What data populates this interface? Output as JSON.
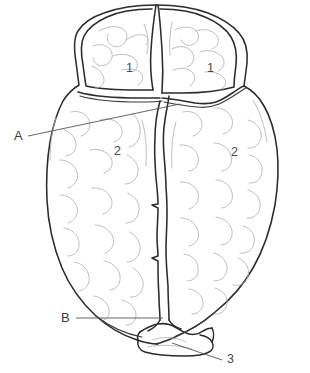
{
  "figure": {
    "kind": "anatomical-line-drawing",
    "view": "superior-dorsal-view-of-brain",
    "background_color": "#ffffff",
    "outline_color": "#2b2b2f",
    "gyrus_color": "#b3b3b8",
    "leader_color": "#55555c",
    "text_color": "#3b3b40"
  },
  "labels": {
    "letter_a": "A",
    "letter_b": "B",
    "number_1_left": "1",
    "number_1_right": "1",
    "number_2_left": "2",
    "number_2_right": "2",
    "number_3": "3"
  },
  "callouts": [
    {
      "text": "A",
      "target": "transverse-fissure"
    },
    {
      "text": "B",
      "target": "longitudinal-fissure-posterior"
    },
    {
      "text": "3",
      "target": "cerebellum"
    }
  ],
  "regions": [
    {
      "id": "frontal-lobe-left",
      "label": "1"
    },
    {
      "id": "frontal-lobe-right",
      "label": "1"
    },
    {
      "id": "cerebral-hemisphere-left",
      "label": "2"
    },
    {
      "id": "cerebral-hemisphere-right",
      "label": "2"
    },
    {
      "id": "cerebellum",
      "label": "3"
    }
  ]
}
